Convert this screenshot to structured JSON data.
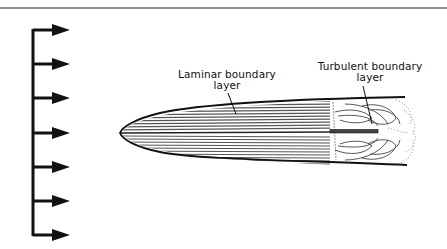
{
  "diagram": {
    "title": "",
    "labels": {
      "laminar": {
        "line1": "Laminar boundary",
        "line2": "layer"
      },
      "turbulent": {
        "line1": "Turbulent boundary",
        "line2": "layer"
      }
    },
    "free_stream_arrows": {
      "count": 7,
      "direction": "right"
    },
    "colors": {
      "stroke": "#111111",
      "hatch": "#555555",
      "background": "#ffffff",
      "rule": "#666666"
    }
  }
}
